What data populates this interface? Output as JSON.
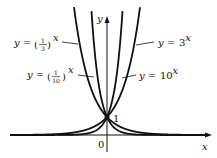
{
  "chart_data": {
    "type": "line",
    "title": "",
    "xlabel": "x",
    "ylabel": "y",
    "xlim": [
      -5.4,
      5.3
    ],
    "ylim": [
      -1.2,
      7.5
    ],
    "grid": false,
    "tick_labels": {
      "origin": "0",
      "y_intercept": "1"
    },
    "annotations": [
      {
        "text": "y = (1/3)^x",
        "series": "(1/3)^x",
        "side": "left"
      },
      {
        "text": "y = (1/10)^x",
        "series": "(1/10)^x",
        "side": "left"
      },
      {
        "text": "y = 3^x",
        "series": "3^x",
        "side": "right"
      },
      {
        "text": "y = 10^x",
        "series": "10^x",
        "side": "right"
      }
    ],
    "series": [
      {
        "name": "(1/3)^x",
        "base": 0.3333
      },
      {
        "name": "(1/10)^x",
        "base": 0.1
      },
      {
        "name": "3^x",
        "base": 3
      },
      {
        "name": "10^x",
        "base": 10
      }
    ],
    "common_point": {
      "x": 0,
      "y": 1
    },
    "color": "#111111"
  }
}
